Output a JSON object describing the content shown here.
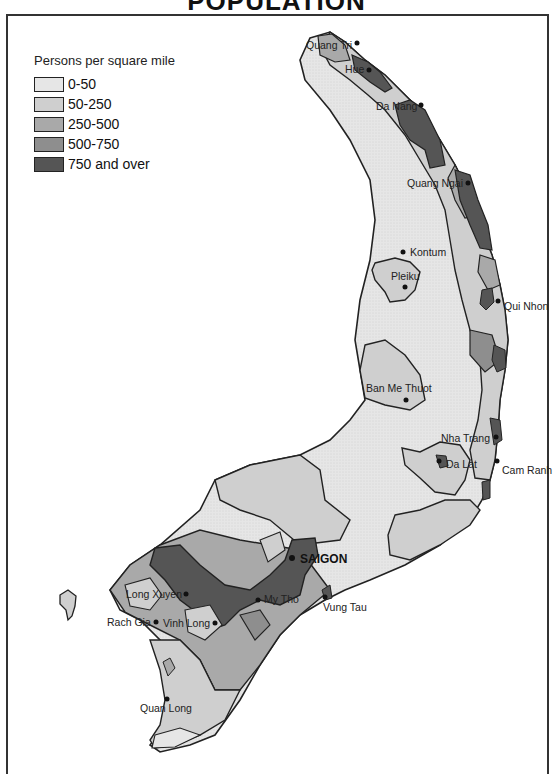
{
  "title": "POPULATION",
  "legend": {
    "title": "Persons per square mile",
    "items": [
      {
        "label": "0-50",
        "color": "#e6e6e6"
      },
      {
        "label": "50-250",
        "color": "#cfcfcf"
      },
      {
        "label": "250-500",
        "color": "#a9a9a9"
      },
      {
        "label": "500-750",
        "color": "#8e8e8e"
      },
      {
        "label": "750 and over",
        "color": "#555555"
      }
    ]
  },
  "cities": [
    {
      "name": "Quang Tri"
    },
    {
      "name": "Hue"
    },
    {
      "name": "Da Nang"
    },
    {
      "name": "Quang Ngai"
    },
    {
      "name": "Kontum"
    },
    {
      "name": "Pleiku"
    },
    {
      "name": "Qui Nhon"
    },
    {
      "name": "Ban Me Thuot"
    },
    {
      "name": "Nha Trang"
    },
    {
      "name": "Da Lat"
    },
    {
      "name": "Cam Ranh"
    },
    {
      "name": "SAIGON"
    },
    {
      "name": "Vung Tau"
    },
    {
      "name": "Long Xuyen"
    },
    {
      "name": "My Tho"
    },
    {
      "name": "Rach Gia"
    },
    {
      "name": "Vinh Long"
    },
    {
      "name": "Quan Long"
    }
  ]
}
